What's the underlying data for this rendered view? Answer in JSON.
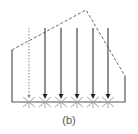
{
  "diagram": {
    "caption": "(b)",
    "colors": {
      "line": "#555555",
      "dashed": "#666666",
      "dotted": "#888888",
      "background": "#ffffff"
    },
    "outline": {
      "left_x": 12,
      "right_x": 125,
      "base_y": 102,
      "left_top_y": 50,
      "right_top_y": 76
    },
    "dashed_profile": [
      [
        12,
        50
      ],
      [
        86,
        10
      ],
      [
        125,
        76
      ]
    ],
    "dotted_line": {
      "x": 29,
      "y1": 28,
      "y2": 98
    },
    "arrows": [
      {
        "x": 45,
        "y1": 28,
        "y2": 99
      },
      {
        "x": 61,
        "y1": 28,
        "y2": 99
      },
      {
        "x": 77,
        "y1": 28,
        "y2": 99
      },
      {
        "x": 93,
        "y1": 28,
        "y2": 99
      },
      {
        "x": 108,
        "y1": 28,
        "y2": 99
      }
    ],
    "supports_x": [
      29,
      45,
      61,
      77,
      93,
      108
    ]
  }
}
